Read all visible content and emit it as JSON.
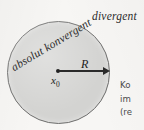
{
  "figure": {
    "name": "convergence-radius-diagram",
    "background_color": "#f7f6f4"
  },
  "disk": {
    "fill_color": "#d3d3d1",
    "stroke_color": "#6f6f6e",
    "inside_label": "absolut konvergent",
    "outside_label": "divergent"
  },
  "center": {
    "point_label": "x",
    "point_subscript": "0"
  },
  "radius": {
    "label": "R"
  },
  "side_caption": {
    "lines": [
      "Ko",
      "im",
      "(re"
    ]
  }
}
